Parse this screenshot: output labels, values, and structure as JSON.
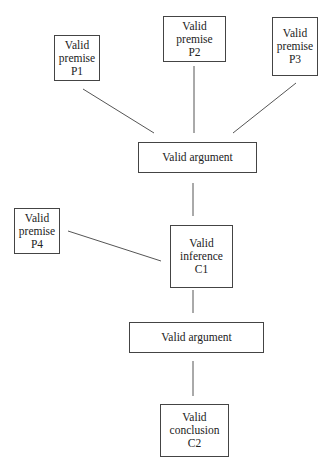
{
  "diagram": {
    "type": "argument-tree",
    "nodes": [
      {
        "id": "P1",
        "lines": [
          "Valid",
          "premise",
          "P1"
        ],
        "box": [
          54,
          35,
          46,
          46
        ]
      },
      {
        "id": "P2",
        "lines": [
          "Valid",
          "premise",
          "P2"
        ],
        "box": [
          163,
          16,
          63,
          46
        ]
      },
      {
        "id": "P3",
        "lines": [
          "Valid",
          "premise",
          "P3"
        ],
        "box": [
          272,
          17,
          46,
          59
        ]
      },
      {
        "id": "A1",
        "lines": [
          "Valid argument"
        ],
        "box": [
          138,
          142,
          119,
          31
        ]
      },
      {
        "id": "P4",
        "lines": [
          "Valid",
          "premise",
          "P4"
        ],
        "box": [
          14,
          208,
          46,
          46
        ]
      },
      {
        "id": "C1",
        "lines": [
          "Valid",
          "inference",
          "C1"
        ],
        "box": [
          170,
          225,
          63,
          63
        ]
      },
      {
        "id": "A2",
        "lines": [
          "Valid argument"
        ],
        "box": [
          129,
          322,
          135,
          31
        ]
      },
      {
        "id": "C2",
        "lines": [
          "Valid",
          "conclusion",
          "C2"
        ],
        "box": [
          160,
          404,
          69,
          53
        ]
      }
    ],
    "edges": [
      {
        "from": "P1",
        "to": "A1",
        "coords": [
          83,
          89,
          154,
          133
        ]
      },
      {
        "from": "P2",
        "to": "A1",
        "coords": [
          194,
          66,
          194,
          133
        ]
      },
      {
        "from": "P3",
        "to": "A1",
        "coords": [
          296,
          83,
          233,
          133
        ]
      },
      {
        "from": "A1",
        "to": "C1",
        "coords": [
          193,
          183,
          193,
          216
        ]
      },
      {
        "from": "P4",
        "to": "C1",
        "coords": [
          68,
          231,
          161,
          261
        ]
      },
      {
        "from": "C1",
        "to": "A2",
        "coords": [
          193,
          290,
          193,
          313
        ]
      },
      {
        "from": "A2",
        "to": "C2",
        "coords": [
          193,
          361,
          193,
          396
        ]
      }
    ]
  },
  "labels": {
    "p1": {
      "l1": "Valid",
      "l2": "premise",
      "l3": "P1"
    },
    "p2": {
      "l1": "Valid",
      "l2": "premise",
      "l3": "P2"
    },
    "p3": {
      "l1": "Valid",
      "l2": "premise",
      "l3": "P3"
    },
    "a1": "Valid argument",
    "p4": {
      "l1": "Valid",
      "l2": "premise",
      "l3": "P4"
    },
    "c1": {
      "l1": "Valid",
      "l2": "inference",
      "l3": "C1"
    },
    "a2": "Valid argument",
    "c2": {
      "l1": "Valid",
      "l2": "conclusion",
      "l3": "C2"
    }
  }
}
